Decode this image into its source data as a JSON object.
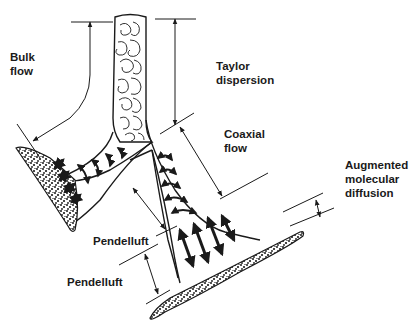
{
  "diagram": {
    "colors": {
      "ink": "#1a1a1a",
      "background": "#ffffff"
    },
    "labels": [
      {
        "id": "bulk-flow",
        "text": "Bulk\nflow",
        "x": 10,
        "y": 50
      },
      {
        "id": "taylor-dispersion",
        "text": "Taylor\ndispersion",
        "x": 216,
        "y": 59
      },
      {
        "id": "coaxial-flow",
        "text": "Coaxial\nflow",
        "x": 224,
        "y": 128
      },
      {
        "id": "augmented-molecular-diffusion",
        "text": "Augmented\nmolecular\ndiffusion",
        "x": 345,
        "y": 159
      },
      {
        "id": "pendelluft-upper",
        "text": "Pendelluft",
        "x": 93,
        "y": 236
      },
      {
        "id": "pendelluft-lower",
        "text": "Pendelluft",
        "x": 67,
        "y": 276
      }
    ]
  }
}
